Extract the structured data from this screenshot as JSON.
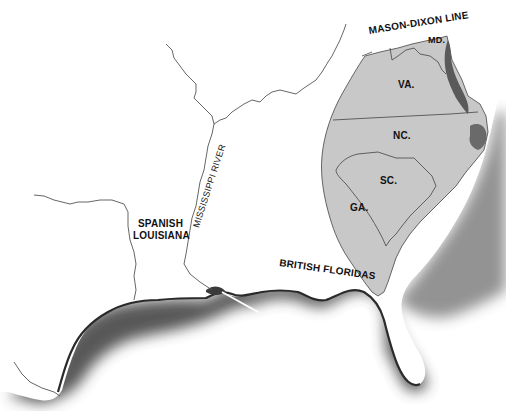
{
  "map": {
    "description": "Southeastern North America, showing the southern colonies and neighboring territories",
    "colors": {
      "colony_fill": "#c8c8c8",
      "bay_fill": "#5a5a5a",
      "border_line": "#444444",
      "river_line": "#555555",
      "coast_shadow": "#3a3a3a",
      "land_background": "#ffffff"
    },
    "labels": {
      "mason_dixon": "MASON-DIXON LINE",
      "md": "MD.",
      "va": "VA.",
      "nc": "NC.",
      "sc": "SC.",
      "ga": "GA.",
      "spanish_louisiana_line1": "SPANISH",
      "spanish_louisiana_line2": "LOUISIANA",
      "mississippi_river": "MISSISSIPPI RIVER",
      "british_floridas": "BRITISH FLORIDAS"
    },
    "regions": [
      {
        "id": "md",
        "name": "MD.",
        "shaded": true
      },
      {
        "id": "va",
        "name": "VA.",
        "shaded": true
      },
      {
        "id": "nc",
        "name": "NC.",
        "shaded": true
      },
      {
        "id": "sc",
        "name": "SC.",
        "shaded": true
      },
      {
        "id": "ga",
        "name": "GA.",
        "shaded": true
      },
      {
        "id": "spanish-louisiana",
        "name": "SPANISH LOUISIANA",
        "shaded": false
      },
      {
        "id": "british-floridas",
        "name": "BRITISH FLORIDAS",
        "shaded": false
      }
    ]
  }
}
